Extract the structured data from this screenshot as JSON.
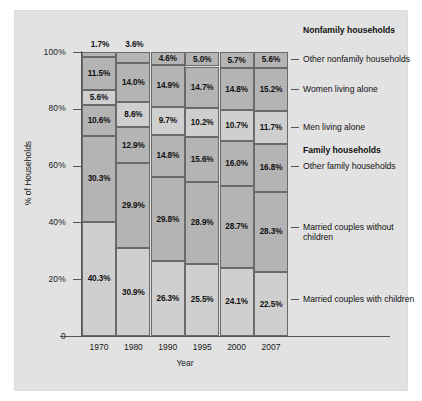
{
  "chart_data": {
    "type": "bar",
    "subtype": "stacked-100-percent",
    "title": "",
    "xlabel": "Year",
    "ylabel": "% of Households",
    "ylim": [
      0,
      100
    ],
    "yticks": [
      "0",
      "20%",
      "40%",
      "60%",
      "80%",
      "100%"
    ],
    "ytick_values": [
      0,
      20,
      40,
      60,
      80,
      100
    ],
    "grid": false,
    "legend_position": "right",
    "categories": [
      "1970",
      "1980",
      "1990",
      "1995",
      "2000",
      "2007"
    ],
    "series": [
      {
        "name": "Married couples with children",
        "group": "Family households",
        "shade": "light",
        "values": [
          40.3,
          30.9,
          26.3,
          25.5,
          24.1,
          22.5
        ],
        "labels": [
          "40.3%",
          "30.9%",
          "26.3%",
          "25.5%",
          "24.1%",
          "22.5%"
        ]
      },
      {
        "name": "Married couples without children",
        "group": "Family households",
        "shade": "dark",
        "values": [
          30.3,
          29.9,
          29.8,
          28.9,
          28.7,
          28.3
        ],
        "labels": [
          "30.3%",
          "29.9%",
          "29.8%",
          "28.9%",
          "28.7%",
          "28.3%"
        ]
      },
      {
        "name": "Other family households",
        "group": "Family households",
        "shade": "darker",
        "values": [
          10.6,
          12.9,
          14.8,
          15.6,
          16.0,
          16.8
        ],
        "labels": [
          "10.6%",
          "12.9%",
          "14.8%",
          "15.6%",
          "16.0%",
          "16.8%"
        ]
      },
      {
        "name": "Men living alone",
        "group": "Nonfamily households",
        "shade": "light",
        "values": [
          5.6,
          8.6,
          9.7,
          10.2,
          10.7,
          11.7
        ],
        "labels": [
          "5.6%",
          "8.6%",
          "9.7%",
          "10.2%",
          "10.7%",
          "11.7%"
        ]
      },
      {
        "name": "Women living alone",
        "group": "Nonfamily households",
        "shade": "dark",
        "values": [
          11.5,
          14.0,
          14.9,
          14.7,
          14.8,
          15.2
        ],
        "labels": [
          "11.5%",
          "14.0%",
          "14.9%",
          "14.7%",
          "14.8%",
          "15.2%"
        ]
      },
      {
        "name": "Other nonfamily households",
        "group": "Nonfamily households",
        "shade": "dark",
        "values": [
          1.7,
          3.6,
          4.6,
          5.0,
          5.7,
          5.6
        ],
        "labels": [
          "1.7%",
          "3.6%",
          "4.6%",
          "5.0%",
          "5.7%",
          "5.6%"
        ]
      }
    ],
    "right_labels": [
      {
        "text": "Nonfamily households",
        "bold": true,
        "dash": false
      },
      {
        "text": "Other nonfamily households",
        "bold": false,
        "dash": true
      },
      {
        "text": "Women living alone",
        "bold": false,
        "dash": true
      },
      {
        "text": "Men living alone",
        "bold": false,
        "dash": true
      },
      {
        "text": "Family households",
        "bold": true,
        "dash": false
      },
      {
        "text": "Other family households",
        "bold": false,
        "dash": true
      },
      {
        "text": "Married couples without children",
        "bold": false,
        "dash": true
      },
      {
        "text": "Married couples with children",
        "bold": false,
        "dash": true
      }
    ],
    "colors": {
      "panel": "#e2e2e2",
      "segment_light": "#cfcfcf",
      "segment_dark": "#b4b4b4",
      "outline": "#6a6a6a",
      "axis": "#555555",
      "text": "#111111"
    }
  }
}
